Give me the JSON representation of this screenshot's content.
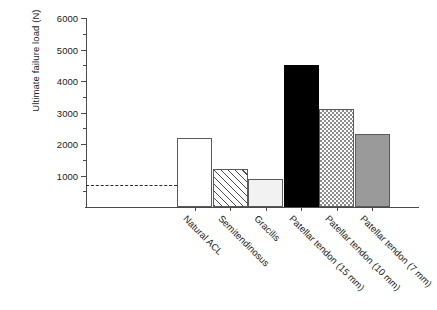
{
  "chart_data": {
    "type": "bar",
    "title": "",
    "subtitle": "",
    "xlabel": "",
    "ylabel": "Ultimate failure load (N)",
    "ylim": [
      0,
      6000
    ],
    "ytick_values": [
      1000,
      2000,
      3000,
      4000,
      5000,
      6000
    ],
    "ytick_labels": [
      "1000",
      "2000",
      "3000",
      "4000",
      "5000",
      "6000"
    ],
    "minor_ticks": [
      500,
      1500,
      2500,
      3500,
      4500,
      5500
    ],
    "grid": false,
    "legend": "none",
    "categories": [
      "Natural ACL",
      "Semitendinosus",
      "Gracilis",
      "Patellar tendon (15 mm)",
      "Patellar tendon (10 mm)",
      "Patellar tendon (7 mm)"
    ],
    "values": [
      2200,
      1220,
      880,
      4500,
      3100,
      2330
    ],
    "bar_styles": [
      "white",
      "hatch",
      "lightgray",
      "black",
      "checker",
      "gray"
    ],
    "annotations": [
      {
        "name": "reference-line",
        "label": "",
        "value": 700,
        "style": "dashed",
        "extent": "from y-axis to Natural ACL bar"
      }
    ]
  },
  "colors": {
    "axis": "#4a4a4a",
    "text": "#1a1a1a",
    "bar_outline": "#5a5a5a",
    "black_bar": "#000000",
    "gray_bar": "#9a9a9a",
    "lightgray_bar": "#f2f2f2",
    "hatch_bar": "#4a4a4a",
    "checker_bar": "#8c8c8c",
    "dashed_line": "#2a2a2a",
    "background": "#ffffff"
  }
}
